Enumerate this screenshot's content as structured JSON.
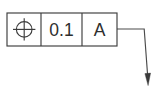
{
  "drawing": {
    "type": "gdt-feature-control-frame",
    "title": "Position tolerance feature control frame",
    "background_color": "#ffffff",
    "line_color": "#3d3d3d",
    "text_color": "#2e2e2e"
  },
  "frame": {
    "cells": [
      {
        "id": "geometric-characteristic",
        "kind": "symbol",
        "symbol": "position-symbol",
        "label": "Position",
        "text": ""
      },
      {
        "id": "tolerance-value",
        "kind": "text",
        "label": "Tolerance zone",
        "text": "0.1"
      },
      {
        "id": "primary-datum",
        "kind": "text",
        "label": "Primary datum reference",
        "text": "A"
      }
    ]
  },
  "leader": {
    "id": "leader-line",
    "label": "Leader line with arrowhead",
    "arrow": "filled-arrowhead-down",
    "color": "#4a4a4a"
  }
}
